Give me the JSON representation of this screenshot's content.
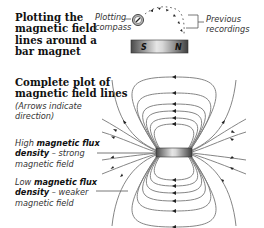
{
  "top_section": {
    "heading_lines": [
      "Plotting the",
      "magnetic field",
      "lines around a",
      "bar magnet"
    ],
    "compass_label_lines": [
      "Plotting",
      "compass"
    ],
    "recordings_label_lines": [
      "Previous",
      "recordings"
    ],
    "magnet": {
      "south_label": "S",
      "north_label": "N"
    }
  },
  "bottom_section": {
    "heading_lines": [
      "Complete plot of",
      "magnetic field lines"
    ],
    "note_lines": [
      "(Arrows indicate",
      "direction)"
    ],
    "high_label": {
      "prefix": "High ",
      "bold1": "magnetic flux",
      "bold2": "density",
      "suffix": " – strong",
      "line3": "magnetic field"
    },
    "low_label": {
      "prefix": "Low ",
      "bold1": "magnetic flux",
      "bold2": "density",
      "suffix": " – weaker",
      "line3": "magnetic field"
    }
  },
  "colors": {
    "field_line": "#707070",
    "arrow": "#222222",
    "text": "#1a1a1a",
    "magnet_dark": "#555555",
    "magnet_light": "#e8e8e8"
  }
}
